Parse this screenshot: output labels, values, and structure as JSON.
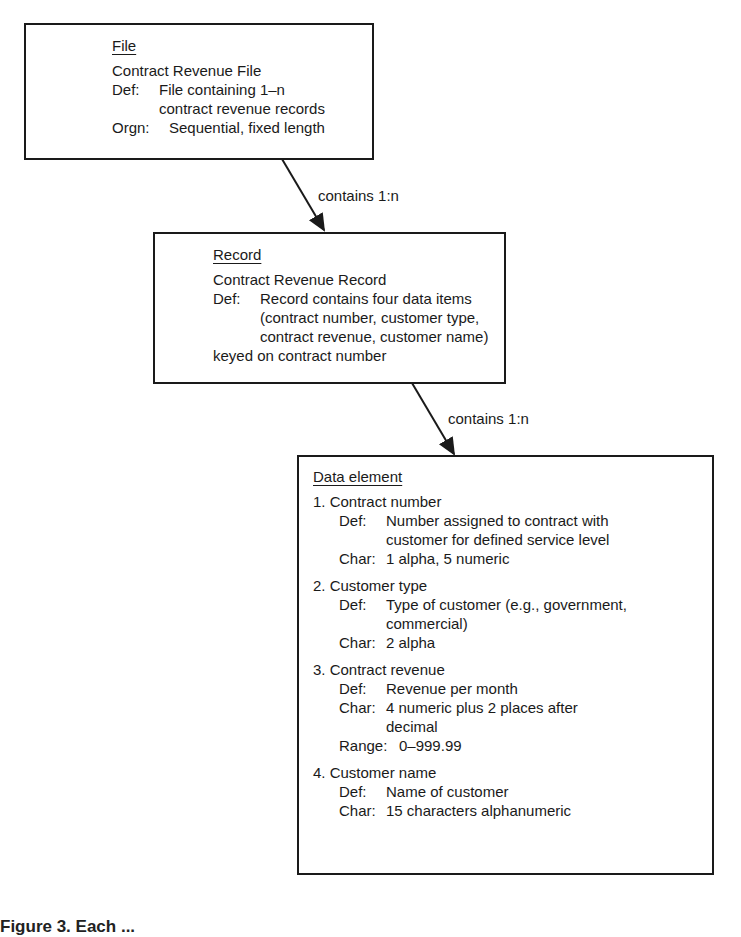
{
  "file_box": {
    "heading": "File",
    "name": "Contract Revenue File",
    "def_label": "Def:",
    "def_line1": "File containing 1–n",
    "def_line2": "contract revenue records",
    "orgn_label": "Orgn:",
    "orgn_value": "Sequential, fixed length"
  },
  "arrow1": {
    "label": "contains 1:n"
  },
  "record_box": {
    "heading": "Record",
    "name": "Contract Revenue Record",
    "def_label": "Def:",
    "def_lines": [
      "Record contains four data items",
      "(contract number, customer type,",
      "contract revenue, customer name)",
      "keyed on contract number"
    ]
  },
  "arrow2": {
    "label": "contains 1:n"
  },
  "element_box": {
    "heading": "Data element",
    "items": [
      {
        "title": "1.  Contract number",
        "def_label": "Def:",
        "def_lines": [
          "Number assigned to contract with",
          "customer for defined service level"
        ],
        "char_label": "Char:",
        "char_lines": [
          "1 alpha, 5 numeric"
        ]
      },
      {
        "title": "2.  Customer type",
        "def_label": "Def:",
        "def_lines": [
          "Type of customer (e.g., government,",
          "commercial)"
        ],
        "char_label": "Char:",
        "char_lines": [
          "2 alpha"
        ]
      },
      {
        "title": "3.  Contract revenue",
        "def_label": "Def:",
        "def_lines": [
          "Revenue per month"
        ],
        "char_label": "Char:",
        "char_lines": [
          "4 numeric plus 2 places after",
          "decimal"
        ],
        "range_label": "Range:",
        "range_value": "0–999.99"
      },
      {
        "title": "4.  Customer name",
        "def_label": "Def:",
        "def_lines": [
          "Name of customer"
        ],
        "char_label": "Char:",
        "char_lines": [
          "15 characters alphanumeric"
        ]
      }
    ]
  },
  "caption": "Figure 3.  Each ..."
}
